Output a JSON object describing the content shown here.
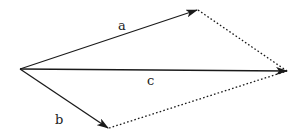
{
  "diagram": {
    "type": "vector-addition-parallelogram",
    "origin": {
      "x": 20,
      "y": 69
    },
    "vectors": [
      {
        "id": "a",
        "label": "a",
        "from": {
          "x": 20,
          "y": 69
        },
        "to": {
          "x": 197,
          "y": 10
        }
      },
      {
        "id": "b",
        "label": "b",
        "from": {
          "x": 20,
          "y": 69
        },
        "to": {
          "x": 108,
          "y": 128
        }
      },
      {
        "id": "c",
        "label": "c",
        "from": {
          "x": 20,
          "y": 69
        },
        "to": {
          "x": 287,
          "y": 71
        }
      }
    ],
    "dotted_edges": [
      {
        "from": "a",
        "to": "c"
      },
      {
        "from": "b",
        "to": "c"
      }
    ],
    "labels": {
      "a": "a",
      "b": "b",
      "c": "c"
    },
    "colors": {
      "stroke": "#1a1a1a",
      "text": "#222222",
      "background": "#ffffff"
    }
  }
}
